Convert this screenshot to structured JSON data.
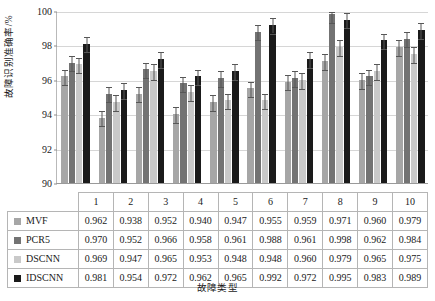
{
  "chart_data": {
    "type": "bar",
    "title": "",
    "xlabel": "故障类型",
    "ylabel": "故障识别准确率/%",
    "ylim": [
      90,
      100
    ],
    "yticks": [
      90,
      92,
      94,
      96,
      98,
      100
    ],
    "grid": true,
    "legend_position": "table-row-header",
    "categories": [
      "1",
      "2",
      "3",
      "4",
      "5",
      "6",
      "7",
      "8",
      "9",
      "10"
    ],
    "value_scale_note": "table values are fractions; bars plot value x 100 as percent",
    "error_bar_percent": 0.45,
    "series": [
      {
        "name": "MVF",
        "color": "#a6a6a6",
        "values": [
          0.962,
          0.938,
          0.952,
          0.94,
          0.947,
          0.955,
          0.959,
          0.971,
          0.96,
          0.979
        ],
        "percents": [
          96.2,
          93.8,
          95.2,
          94.0,
          94.7,
          95.5,
          95.9,
          97.1,
          96.0,
          97.9
        ]
      },
      {
        "name": "PCR5",
        "color": "#737373",
        "values": [
          0.97,
          0.952,
          0.966,
          0.958,
          0.961,
          0.988,
          0.961,
          0.998,
          0.962,
          0.984
        ],
        "percents": [
          97.0,
          95.2,
          96.6,
          95.8,
          96.1,
          98.8,
          96.1,
          99.8,
          96.2,
          98.4
        ]
      },
      {
        "name": "DSCNN",
        "color": "#c9c9c9",
        "values": [
          0.969,
          0.947,
          0.965,
          0.953,
          0.948,
          0.948,
          0.96,
          0.979,
          0.965,
          0.975
        ],
        "percents": [
          96.9,
          94.7,
          96.5,
          95.3,
          94.8,
          94.8,
          96.0,
          97.9,
          96.5,
          97.5
        ]
      },
      {
        "name": "IDSCNN",
        "color": "#1a1a1a",
        "values": [
          0.981,
          0.954,
          0.972,
          0.962,
          0.965,
          0.992,
          0.972,
          0.995,
          0.983,
          0.989
        ],
        "percents": [
          98.1,
          95.4,
          97.2,
          96.2,
          96.5,
          99.2,
          97.2,
          99.5,
          98.3,
          98.9
        ]
      }
    ]
  },
  "axis": {
    "ylabel": "故障识别准确率/%",
    "xlabel": "故障类型",
    "yticks": [
      "100",
      "98",
      "96",
      "94",
      "92",
      "90"
    ]
  },
  "table": {
    "corner_label": "",
    "column_headers": [
      "1",
      "2",
      "3",
      "4",
      "5",
      "6",
      "7",
      "8",
      "9",
      "10"
    ],
    "rows": [
      {
        "label": "MVF",
        "swatch_color": "#a6a6a6",
        "cells": [
          "0.962",
          "0.938",
          "0.952",
          "0.940",
          "0.947",
          "0.955",
          "0.959",
          "0.971",
          "0.960",
          "0.979"
        ]
      },
      {
        "label": "PCR5",
        "swatch_color": "#737373",
        "cells": [
          "0.970",
          "0.952",
          "0.966",
          "0.958",
          "0.961",
          "0.988",
          "0.961",
          "0.998",
          "0.962",
          "0.984"
        ]
      },
      {
        "label": "DSCNN",
        "swatch_color": "#c9c9c9",
        "cells": [
          "0.969",
          "0.947",
          "0.965",
          "0.953",
          "0.948",
          "0.948",
          "0.960",
          "0.979",
          "0.965",
          "0.975"
        ]
      },
      {
        "label": "IDSCNN",
        "swatch_color": "#1a1a1a",
        "cells": [
          "0.981",
          "0.954",
          "0.972",
          "0.962",
          "0.965",
          "0.992",
          "0.972",
          "0.995",
          "0.983",
          "0.989"
        ]
      }
    ]
  }
}
